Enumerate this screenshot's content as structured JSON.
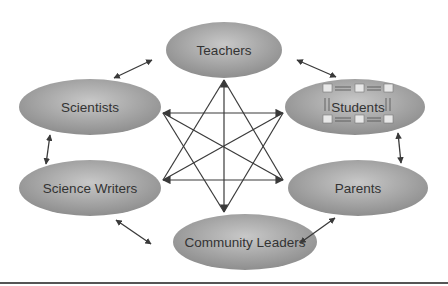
{
  "diagram": {
    "type": "stakeholder-network",
    "colors": {
      "ellipse_light": "#c8c8c8",
      "ellipse_dark": "#8e8e8e",
      "arrow": "#3a3a3a",
      "text": "#333333",
      "rule": "#555555"
    },
    "nodes": [
      {
        "id": "teachers",
        "label": "Teachers"
      },
      {
        "id": "scientists",
        "label": "Scientists"
      },
      {
        "id": "students",
        "label": "Students"
      },
      {
        "id": "science-writers",
        "label": "Science Writers"
      },
      {
        "id": "parents",
        "label": "Parents"
      },
      {
        "id": "community-leaders",
        "label": "Community Leaders"
      }
    ],
    "outer_links": [
      [
        "teachers",
        "scientists"
      ],
      [
        "teachers",
        "students"
      ],
      [
        "scientists",
        "science-writers"
      ],
      [
        "students",
        "parents"
      ],
      [
        "science-writers",
        "community-leaders"
      ],
      [
        "parents",
        "community-leaders"
      ]
    ],
    "center_star": "all-to-all bidirectional arrows between the six groups",
    "students_icon": "networked computers"
  }
}
